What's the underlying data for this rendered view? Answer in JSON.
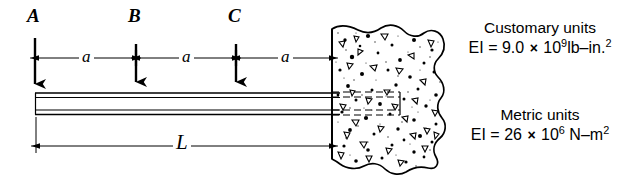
{
  "figure": {
    "points": [
      {
        "name": "A",
        "label": "A",
        "x": 35
      },
      {
        "name": "B",
        "label": "B",
        "x": 136
      },
      {
        "name": "C",
        "label": "C",
        "x": 236
      }
    ],
    "dimensions": {
      "segments": [
        {
          "label": "a",
          "from": 35,
          "to": 136
        },
        {
          "label": "a",
          "from": 136,
          "to": 236
        },
        {
          "label": "a",
          "from": 236,
          "to": 332
        }
      ],
      "total": {
        "label": "L",
        "from": 36,
        "to": 332
      }
    },
    "support": {
      "name": "fixed-concrete-wall",
      "type": "fixed-support",
      "left_edge_x": 332
    },
    "beam": {
      "name": "beam",
      "start_x": 35,
      "end_x": 340
    }
  },
  "notes": {
    "customary": {
      "title": "Customary units",
      "quantity": "EI",
      "equals": "=",
      "coefficient": "9.0",
      "times": "×",
      "base": "10",
      "exponent": "9",
      "units": "lb–in.",
      "units_exponent": "2"
    },
    "metric": {
      "title": "Metric units",
      "quantity": "EI",
      "equals": "=",
      "coefficient": "26",
      "times": "×",
      "base": "10",
      "exponent": "6",
      "units": " N–m",
      "units_exponent": "2"
    }
  },
  "colors": {
    "ink": "#000000",
    "background": "#ffffff"
  }
}
